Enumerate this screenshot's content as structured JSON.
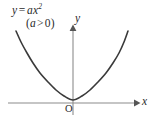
{
  "figure": {
    "background_color": "#ffffff",
    "curve_color": "#3a3a3a",
    "axis_color": "#8c8c8c",
    "text_color": "#2b2b2b",
    "labels": {
      "equation_y": "y",
      "equation_equals": "=",
      "equation_coefficient": "a",
      "equation_variable": "x",
      "equation_exponent": "2",
      "condition_open": "(",
      "condition_coefficient": "a",
      "condition_operator": ">",
      "condition_value": "0",
      "condition_close": ")",
      "y_axis": "y",
      "x_axis": "x",
      "origin": "O"
    }
  },
  "chart_data": {
    "type": "line",
    "xlabel": "x",
    "ylabel": "y",
    "legend": [],
    "grid": false,
    "annotations": [
      "y = ax²",
      "(a > 0)",
      "O"
    ],
    "axis_origin_px": {
      "x": 73,
      "y": 103
    },
    "xlim": [
      -6,
      6
    ],
    "ylim": [
      0,
      9
    ],
    "series": [
      {
        "name": "y = ax^2",
        "equation": "y = a*x^2",
        "a": 0.25,
        "x": [
          -5.2,
          -4.6,
          -4.0,
          -3.4,
          -2.8,
          -2.2,
          -1.6,
          -1.0,
          -0.4,
          0.0,
          0.4,
          1.0,
          1.6,
          2.2,
          2.8,
          3.4,
          4.0,
          4.6,
          5.2
        ],
        "values": [
          6.76,
          5.29,
          4.0,
          2.89,
          1.96,
          1.21,
          0.64,
          0.25,
          0.04,
          0.0,
          0.04,
          0.25,
          0.64,
          1.21,
          1.96,
          2.89,
          4.0,
          5.29,
          6.76
        ]
      }
    ],
    "points_px": [
      [
        16,
        31
      ],
      [
        21,
        42
      ],
      [
        27,
        53
      ],
      [
        33,
        63
      ],
      [
        40,
        73
      ],
      [
        48,
        82
      ],
      [
        56,
        90
      ],
      [
        64,
        96
      ],
      [
        73,
        100
      ],
      [
        82,
        96
      ],
      [
        90,
        90
      ],
      [
        98,
        82
      ],
      [
        106,
        73
      ],
      [
        113,
        63
      ],
      [
        119,
        53
      ],
      [
        124,
        42
      ],
      [
        128,
        31
      ]
    ]
  }
}
